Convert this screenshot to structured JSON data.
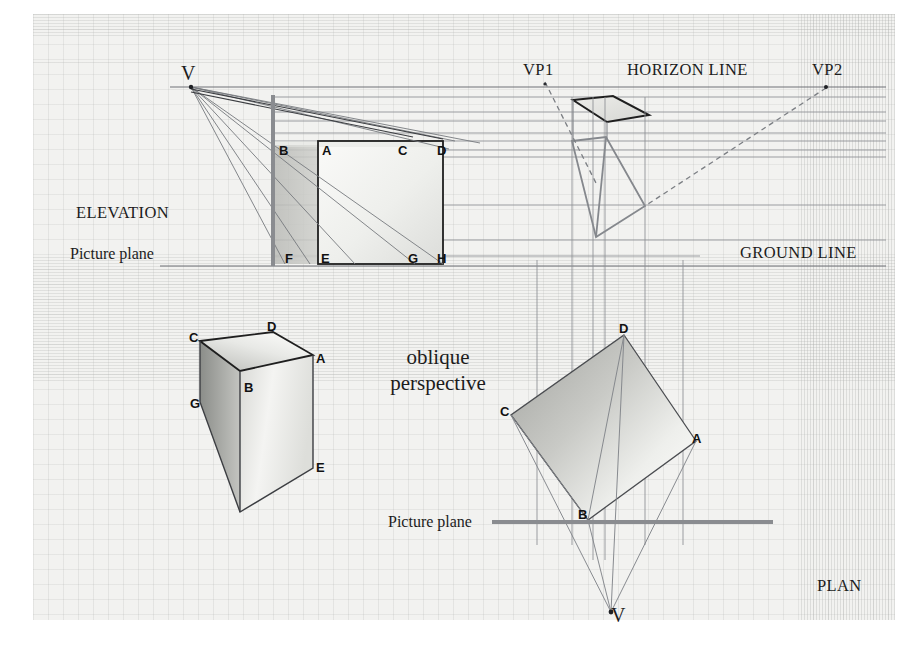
{
  "figure": {
    "title_phrase_line1": "oblique",
    "title_phrase_line2": "perspective",
    "sections": {
      "elevation_label": "ELEVATION",
      "plan_label": "PLAN"
    },
    "lines": {
      "horizon_label": "HORIZON LINE",
      "ground_label": "GROUND LINE",
      "picture_plane_elevation": "Picture plane",
      "picture_plane_plan": "Picture plane"
    },
    "vanishing_points": {
      "vp1": "VP1",
      "vp2": "VP2",
      "station_point_elevation": "V",
      "station_point_plan": "V"
    },
    "elevation_vertices": {
      "b": "B",
      "a": "A",
      "c": "C",
      "d": "D",
      "f": "F",
      "e": "E",
      "g": "G",
      "h": "H"
    },
    "oblique_box_vertices": {
      "c": "C",
      "d": "D",
      "a": "A",
      "b": "B",
      "g": "G",
      "e": "E"
    },
    "plan_vertices": {
      "d": "D",
      "c": "C",
      "a": "A",
      "b": "B"
    },
    "colors": {
      "paper": "#f2f2f0",
      "ink_dark": "#1c1c1c",
      "construction_line": "#7a7d82",
      "heavy_rule": "#8e9094",
      "fill_light": "#f4f4f2",
      "fill_mid": "#c9cac6",
      "fill_dark": "#a9aaa6"
    }
  }
}
